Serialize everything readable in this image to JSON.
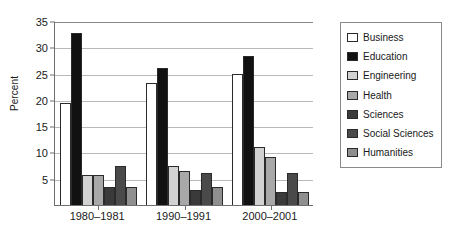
{
  "chart_data": {
    "type": "bar",
    "title": "",
    "xlabel": "",
    "ylabel": "Percent",
    "categories": [
      "1980–1981",
      "1990–1991",
      "2000–2001"
    ],
    "ylim": [
      0,
      35
    ],
    "yticks": [
      0,
      5,
      10,
      15,
      20,
      25,
      30,
      35
    ],
    "ytick_labels": [
      "",
      "5",
      "10",
      "15",
      "20",
      "25",
      "30",
      "35"
    ],
    "grid": true,
    "legend_position": "right",
    "series": [
      {
        "name": "Business",
        "color": "#ffffff",
        "values": [
          19.4,
          23.3,
          25.0
        ]
      },
      {
        "name": "Education",
        "color": "#111111",
        "values": [
          32.7,
          26.1,
          28.3
        ]
      },
      {
        "name": "Engineering",
        "color": "#d2d2d2",
        "values": [
          5.8,
          7.4,
          11.0
        ]
      },
      {
        "name": "Health",
        "color": "#a8a8a8",
        "values": [
          5.7,
          6.4,
          9.2
        ]
      },
      {
        "name": "Sciences",
        "color": "#3a3a3a",
        "values": [
          3.4,
          2.9,
          2.4
        ]
      },
      {
        "name": "Social Sciences",
        "color": "#4a4a4a",
        "values": [
          7.5,
          6.0,
          6.0
        ]
      },
      {
        "name": "Humanities",
        "color": "#8f8f8f",
        "values": [
          3.4,
          3.4,
          2.4
        ]
      }
    ]
  }
}
